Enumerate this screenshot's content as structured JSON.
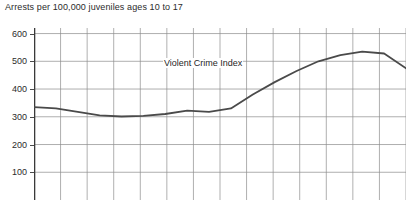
{
  "chart_data": {
    "type": "line",
    "title": "Arrests per 100,000 juveniles ages 10 to 17",
    "xlabel": "",
    "ylabel": "",
    "ylim": [
      0,
      620
    ],
    "y_ticks": [
      600,
      500,
      400,
      300,
      200,
      100
    ],
    "grid": true,
    "legend_position": "inline-annotation",
    "x_gridline_count": 15,
    "series": [
      {
        "name": "Violent Crime Index",
        "annotation": "Violent Crime Index",
        "color": "#4a4a4a",
        "values": [
          335,
          330,
          318,
          305,
          301,
          303,
          310,
          322,
          318,
          330,
          380,
          425,
          465,
          500,
          522,
          535,
          528,
          475
        ]
      }
    ]
  },
  "axis": {
    "y_labels": [
      "600",
      "500",
      "400",
      "300",
      "200",
      "100"
    ]
  }
}
